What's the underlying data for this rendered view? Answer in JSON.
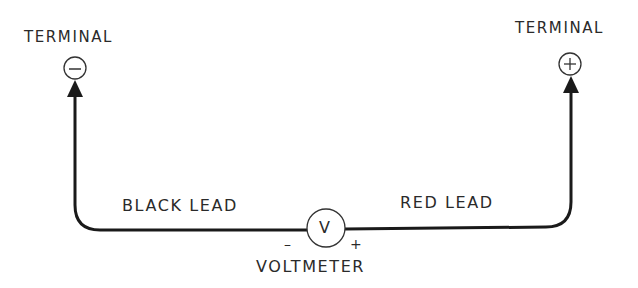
{
  "diagram": {
    "terminal_negative": {
      "label": "TERMINAL",
      "symbol": "−"
    },
    "terminal_positive": {
      "label": "TERMINAL",
      "symbol": "+"
    },
    "black_lead": {
      "label": "BLACK LEAD"
    },
    "red_lead": {
      "label": "RED LEAD"
    },
    "voltmeter": {
      "label": "VOLTMETER",
      "symbol": "V",
      "neg_sign": "–",
      "pos_sign": "+"
    },
    "colors": {
      "line": "#1a1a1a",
      "text": "#2a2a2a",
      "background": "#ffffff"
    }
  }
}
